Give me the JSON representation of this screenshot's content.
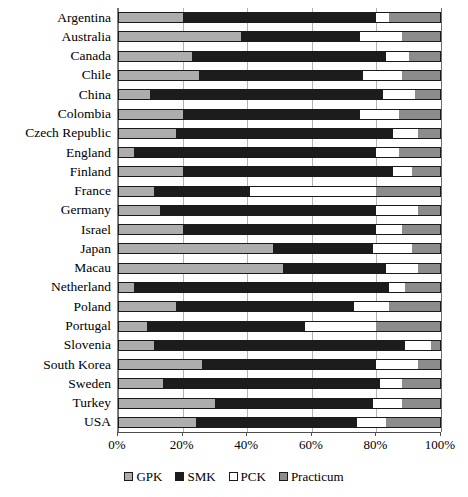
{
  "chart_data": {
    "type": "bar",
    "orientation": "horizontal",
    "stacked": true,
    "stack_mode": "percent",
    "title": "",
    "xlabel": "",
    "ylabel": "",
    "xlim": [
      0,
      100
    ],
    "xticks": [
      0,
      20,
      40,
      60,
      80,
      100
    ],
    "xtick_labels": [
      "0%",
      "20%",
      "40%",
      "60%",
      "80%",
      "100%"
    ],
    "grid": true,
    "grid_axis": "x",
    "legend_position": "bottom",
    "categories": [
      "Argentina",
      "Australia",
      "Canada",
      "Chile",
      "China",
      "Colombia",
      "Czech Republic",
      "England",
      "Finland",
      "France",
      "Germany",
      "Israel",
      "Japan",
      "Macau",
      "Netherland",
      "Poland",
      "Portugal",
      "Slovenia",
      "South Korea",
      "Sweden",
      "Turkey",
      "USA"
    ],
    "series": [
      {
        "name": "GPK",
        "color": "#adadad",
        "values": [
          20,
          38,
          23,
          25,
          10,
          20,
          18,
          5,
          20,
          11,
          13,
          20,
          48,
          51,
          5,
          18,
          9,
          11,
          26,
          14,
          30,
          24
        ]
      },
      {
        "name": "SMK",
        "color": "#1c1c1c",
        "values": [
          60,
          37,
          60,
          51,
          72,
          55,
          67,
          75,
          65,
          30,
          67,
          60,
          31,
          32,
          79,
          55,
          49,
          78,
          54,
          67,
          49,
          50
        ]
      },
      {
        "name": "PCK",
        "color": "#ffffff",
        "values": [
          4,
          13,
          7,
          12,
          10,
          12,
          8,
          7,
          6,
          39,
          13,
          8,
          12,
          10,
          5,
          11,
          22,
          8,
          13,
          7,
          9,
          9
        ]
      },
      {
        "name": "Practicum",
        "color": "#8c8c8c",
        "values": [
          16,
          12,
          10,
          12,
          8,
          13,
          7,
          13,
          9,
          20,
          7,
          12,
          9,
          7,
          11,
          16,
          20,
          3,
          7,
          12,
          12,
          17
        ]
      }
    ]
  },
  "legend": {
    "items": [
      {
        "label": "GPK",
        "color": "#adadad"
      },
      {
        "label": "SMK",
        "color": "#1c1c1c"
      },
      {
        "label": "PCK",
        "color": "#ffffff"
      },
      {
        "label": "Practicum",
        "color": "#8c8c8c"
      }
    ]
  }
}
